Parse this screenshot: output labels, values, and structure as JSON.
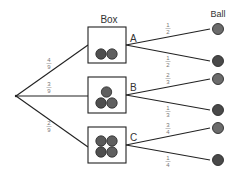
{
  "diagram": {
    "title_box": "Box",
    "title_ball": "Ball",
    "colors": {
      "line": "#222222",
      "box_border": "#222222",
      "ball_light": "#6b6b6b",
      "ball_dark": "#494949",
      "ball_stroke": "#2a2a2a",
      "fraction_text": "#777777"
    },
    "root_branches": [
      {
        "to": "A",
        "num": "4",
        "den": "9"
      },
      {
        "to": "B",
        "num": "3",
        "den": "9"
      },
      {
        "to": "C",
        "num": "2",
        "den": "9"
      }
    ],
    "boxes": [
      {
        "label": "A",
        "balls_inside": 2,
        "branches": [
          {
            "num": "1",
            "den": "2",
            "ball": "light"
          },
          {
            "num": "1",
            "den": "2",
            "ball": "dark"
          }
        ]
      },
      {
        "label": "B",
        "balls_inside": 3,
        "branches": [
          {
            "num": "2",
            "den": "3",
            "ball": "light"
          },
          {
            "num": "1",
            "den": "3",
            "ball": "dark"
          }
        ]
      },
      {
        "label": "C",
        "balls_inside": 4,
        "branches": [
          {
            "num": "3",
            "den": "4",
            "ball": "light"
          },
          {
            "num": "1",
            "den": "4",
            "ball": "dark"
          }
        ]
      }
    ]
  }
}
